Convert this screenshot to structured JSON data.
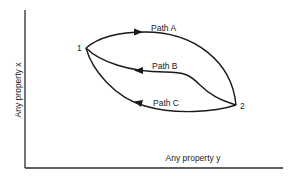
{
  "diagram": {
    "type": "process-paths-diagram",
    "axes": {
      "x_label": "Any property y",
      "y_label": "Any property x"
    },
    "states": [
      {
        "id": "1",
        "label": "1"
      },
      {
        "id": "2",
        "label": "2"
      }
    ],
    "paths": [
      {
        "id": "A",
        "label": "Path A",
        "from": "1",
        "to": "2",
        "direction": "1 → 2"
      },
      {
        "id": "B",
        "label": "Path B",
        "from": "2",
        "to": "1",
        "direction": "2 → 1"
      },
      {
        "id": "C",
        "label": "Path C",
        "from": "2",
        "to": "1",
        "direction": "2 → 1"
      }
    ],
    "colors": {
      "line": "#1a1a1a",
      "background": "#ffffff"
    }
  }
}
